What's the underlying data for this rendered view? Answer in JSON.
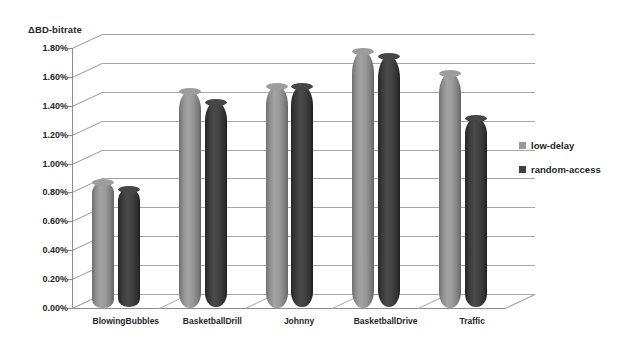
{
  "chart_data": {
    "type": "bar",
    "title": "",
    "ylabel": "ΔBD-bitrate",
    "xlabel": "",
    "categories": [
      "BlowingBubbles",
      "BasketballDrill",
      "Johnny",
      "BasketballDrive",
      "Traffic"
    ],
    "series": [
      {
        "name": "low-delay",
        "color": "#999999",
        "values": [
          0.0087,
          0.015,
          0.0154,
          0.0178,
          0.0163
        ]
      },
      {
        "name": "random-access",
        "color": "#404040",
        "values": [
          0.0082,
          0.0142,
          0.0153,
          0.0174,
          0.0131
        ]
      }
    ],
    "ytick_labels": [
      "1.80%",
      "1.60%",
      "1.40%",
      "1.20%",
      "1.00%",
      "0.80%",
      "0.60%",
      "0.40%",
      "0.20%",
      "0.00%"
    ],
    "ytick_values": [
      0.018,
      0.016,
      0.014,
      0.012,
      0.01,
      0.008,
      0.006,
      0.004,
      0.002,
      0.0
    ],
    "ylim": [
      0.0,
      0.018
    ],
    "grid": true,
    "legend_position": "right",
    "chart_style": "3d-cylinder"
  },
  "legend": {
    "items": [
      {
        "label": "low-delay",
        "color": "#999999"
      },
      {
        "label": "random-access",
        "color": "#404040"
      }
    ]
  }
}
